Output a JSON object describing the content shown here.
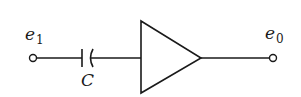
{
  "diagram": {
    "type": "circuit",
    "input": {
      "label": "e",
      "subscript": "1"
    },
    "output": {
      "label": "e",
      "subscript": "0"
    },
    "capacitor": {
      "label": "C"
    },
    "amplifier": {
      "symbol": "triangle"
    },
    "colors": {
      "stroke": "#1a1a1a",
      "background": "#ffffff"
    }
  }
}
